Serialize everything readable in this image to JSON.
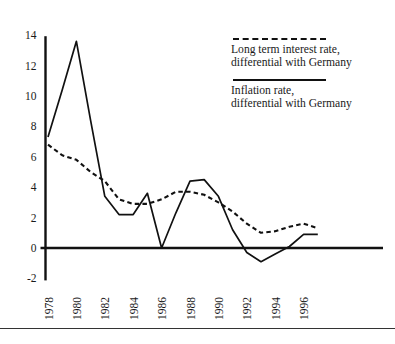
{
  "chart_data": {
    "type": "line",
    "title": "",
    "subtitle": "",
    "xlabel": "",
    "ylabel": "",
    "xlim": [
      1978,
      1997
    ],
    "ylim": [
      -2,
      14
    ],
    "y_ticks": [
      -2,
      0,
      2,
      4,
      6,
      8,
      10,
      12,
      14
    ],
    "y_tick_labels": [
      "-2",
      "0",
      "2",
      "4",
      "6",
      "8",
      "10",
      "12",
      "14"
    ],
    "x_ticks": [
      1978,
      1980,
      1982,
      1984,
      1986,
      1988,
      1990,
      1992,
      1994,
      1996
    ],
    "x_tick_labels": [
      "1978",
      "1980",
      "1982",
      "1984",
      "1986",
      "1988",
      "1990",
      "1992",
      "1994",
      "1996"
    ],
    "x_tick_rotation": 90,
    "grid": false,
    "legend_position": "upper right",
    "zero_line": true,
    "x": [
      1978,
      1979,
      1980,
      1981,
      1982,
      1983,
      1984,
      1985,
      1986,
      1987,
      1988,
      1989,
      1990,
      1991,
      1992,
      1993,
      1994,
      1995,
      1996,
      1997
    ],
    "series": [
      {
        "name": "Long term interest rate, differential with Germany",
        "style": "dashed",
        "color": "#111111",
        "values": [
          6.8,
          6.1,
          5.8,
          5.0,
          4.4,
          3.2,
          2.9,
          2.9,
          3.2,
          3.7,
          3.7,
          3.5,
          3.0,
          2.4,
          1.6,
          1.0,
          1.1,
          1.4,
          1.6,
          1.3
        ]
      },
      {
        "name": "Inflation rate, differential with Germany",
        "style": "solid",
        "color": "#111111",
        "values": [
          7.3,
          10.4,
          13.6,
          8.4,
          3.4,
          2.2,
          2.2,
          3.6,
          0.0,
          2.3,
          4.4,
          4.5,
          3.4,
          1.2,
          -0.3,
          -0.9,
          -0.4,
          0.1,
          0.9,
          0.9
        ]
      }
    ]
  },
  "legend": {
    "entries": [
      {
        "sample": "dashed-line-sample",
        "label": "Long term interest rate,\ndifferential with Germany"
      },
      {
        "sample": "solid-line-sample",
        "label": "Inflation rate,\ndifferential with Germany"
      }
    ]
  }
}
